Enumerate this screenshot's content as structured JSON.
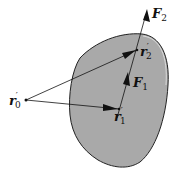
{
  "diagram": {
    "type": "rigid-body-forces",
    "body_fill": "#a9a9a9",
    "labels": {
      "r0": {
        "base": "r",
        "prime": "′",
        "sub": "0"
      },
      "r1": {
        "base": "r",
        "prime": "′",
        "sub": "1"
      },
      "r2": {
        "base": "r",
        "prime": "′",
        "sub": "2"
      },
      "F1": {
        "base": "F",
        "sub": "1"
      },
      "F2": {
        "base": "F",
        "sub": "2"
      }
    }
  }
}
